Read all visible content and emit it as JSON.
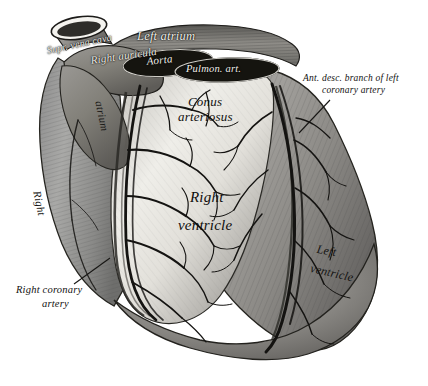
{
  "figure": {
    "kind": "anatomical-engraving",
    "background_color": "#ffffff",
    "ink_color": "#1a1a1a"
  },
  "labels": {
    "supr_vena_cava": "Supr. vena cava",
    "left_atrium": "Left atrium",
    "right_auricula": "Right auricula",
    "aorta": "Aorta",
    "pulmon_art": "Pulmon. art.",
    "right_atrium_word1": "Right",
    "right_atrium_word2": "atrium",
    "conus_line1": "Conus",
    "conus_line2": "arteriosus",
    "ant_desc_line1": "Ant. desc. branch of left",
    "ant_desc_line2": "coronary artery",
    "right_ventricle_line1": "Right",
    "right_ventricle_line2": "ventricle",
    "left_ventricle_line1": "Left",
    "left_ventricle_line2": "ventricle",
    "right_edge_word": "Right",
    "right_coronary_line1": "Right coronary",
    "right_coronary_line2": "artery"
  }
}
